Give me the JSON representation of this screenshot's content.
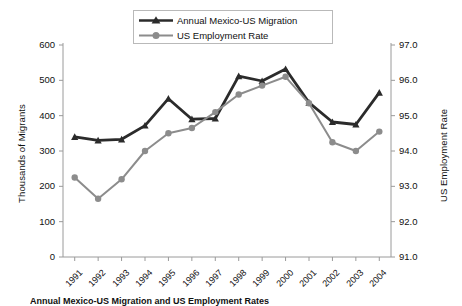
{
  "chart_data": {
    "type": "line",
    "title": "",
    "xlabel": "",
    "ylabel": "Thousands of Migrants",
    "y2label": "US Employment Rate",
    "categories": [
      "1991",
      "1992",
      "1993",
      "1994",
      "1995",
      "1996",
      "1997",
      "1998",
      "1999",
      "2000",
      "2001",
      "2002",
      "2003",
      "2004"
    ],
    "ylim": [
      0,
      600
    ],
    "y2lim": [
      91.0,
      97.0
    ],
    "yticks": [
      "0",
      "100",
      "200",
      "300",
      "400",
      "500",
      "600"
    ],
    "y2ticks": [
      "91.0",
      "92.0",
      "93.0",
      "94.0",
      "95.0",
      "96.0",
      "97.0"
    ],
    "grid": false,
    "legend_position": "top-center",
    "series": [
      {
        "name": "Annual Mexico-US Migration",
        "axis": "left",
        "color": "#2b2b2b",
        "marker": "triangle",
        "values": [
          340,
          330,
          333,
          372,
          448,
          390,
          392,
          512,
          498,
          532,
          437,
          382,
          375,
          465
        ]
      },
      {
        "name": "US Employment Rate",
        "axis": "right",
        "color": "#8c8c8c",
        "marker": "circle",
        "values": [
          93.25,
          92.65,
          93.2,
          94.0,
          94.5,
          94.65,
          95.1,
          95.6,
          95.85,
          96.1,
          95.35,
          94.25,
          94.0,
          94.55
        ]
      }
    ]
  },
  "caption": {
    "text": "Annual Mexico-US Migration and US Employment Rates"
  }
}
